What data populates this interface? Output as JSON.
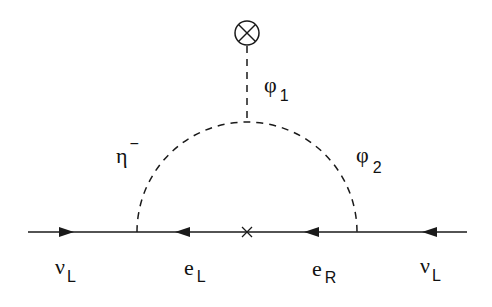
{
  "diagram": {
    "type": "feynman",
    "colors": {
      "line": "#1a1a1a",
      "background": "#ffffff"
    },
    "vertex_insertion": {
      "symbol": "⊗",
      "name": "vev-insertion"
    },
    "mass_insertion": {
      "symbol": "×",
      "name": "mass-insertion"
    },
    "scalar_lines": {
      "eta": {
        "base": "η",
        "sup": "−"
      },
      "phi1": {
        "base": "φ",
        "sub": "1"
      },
      "phi2": {
        "base": "φ",
        "sub": "2"
      }
    },
    "fermion_lines": [
      {
        "base": "ν",
        "sub": "L"
      },
      {
        "base": "e",
        "sub": "L"
      },
      {
        "base": "e",
        "sub": "R"
      },
      {
        "base": "ν",
        "sub": "L"
      }
    ]
  }
}
